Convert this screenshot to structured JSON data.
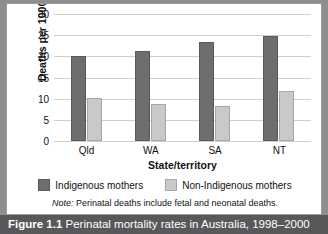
{
  "figure": {
    "caption_number": "Figure 1.1",
    "caption_text": "Perinatal mortality rates in Australia, 1998–2000",
    "note_label": "Note:",
    "note_text": "Perinatal deaths include fetal and neonatal deaths.",
    "frame_color": "#8e8e8e",
    "caption_bar_color": "#58585a"
  },
  "chart_data": {
    "type": "bar",
    "title": "Perinatal mortality rates in Australia, 1998–2000",
    "subtitle": "",
    "xlabel": "State/territory",
    "ylabel": "Deaths per 1000 births",
    "categories": [
      "Qld",
      "WA",
      "SA",
      "NT"
    ],
    "series": [
      {
        "name": "Indigenous mothers",
        "color": "#6e6e6e",
        "values": [
          20.0,
          21.3,
          23.5,
          24.7
        ]
      },
      {
        "name": "Non-Indigenous mothers",
        "color": "#c9c9c9",
        "values": [
          10.2,
          8.7,
          8.2,
          11.8
        ]
      }
    ],
    "ylim": [
      0,
      30
    ],
    "yticks": [
      0,
      5,
      10,
      15,
      20,
      25,
      30
    ],
    "ytick_labels": [
      "0",
      "5",
      "10",
      "15",
      "20",
      "25",
      "30"
    ],
    "grid": true,
    "grid_axis": "y",
    "legend_position": "bottom",
    "annotations": [
      "Note: Perinatal deaths include fetal and neonatal deaths."
    ]
  }
}
